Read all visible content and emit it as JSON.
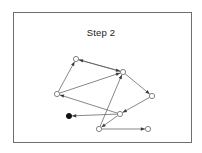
{
  "figure": {
    "title": "Step 2",
    "frame": {
      "x": 13,
      "y": 12,
      "width": 179,
      "height": 131,
      "border_color": "#6e6e6e"
    }
  },
  "chart_data": {
    "type": "scatter",
    "title": "Step 2",
    "xlabel": "",
    "ylabel": "",
    "grid": false,
    "legend": null,
    "xlim": [
      13,
      192
    ],
    "ylim": [
      12,
      143
    ],
    "node_style": {
      "open_fill": "#ffffff",
      "open_stroke": "#777777",
      "filled_fill": "#111111",
      "radius": 2.6
    },
    "edge_style": {
      "color": "#555555",
      "width": 0.7,
      "arrow_color": "#3a3a3a",
      "directed": true
    },
    "nodes": [
      {
        "id": "n1",
        "x": 76,
        "y": 59,
        "state": "open"
      },
      {
        "id": "n2",
        "x": 123,
        "y": 72,
        "state": "open"
      },
      {
        "id": "n3",
        "x": 57,
        "y": 94,
        "state": "open"
      },
      {
        "id": "n4",
        "x": 152,
        "y": 96,
        "state": "open"
      },
      {
        "id": "n5",
        "x": 120,
        "y": 114,
        "state": "open"
      },
      {
        "id": "n6",
        "x": 69,
        "y": 116,
        "state": "filled"
      },
      {
        "id": "n7",
        "x": 99,
        "y": 129,
        "state": "open"
      },
      {
        "id": "n8",
        "x": 148,
        "y": 129,
        "state": "open"
      }
    ],
    "edges": [
      {
        "from": "n3",
        "to": "n1"
      },
      {
        "from": "n3",
        "to": "n2"
      },
      {
        "from": "n2",
        "to": "n1"
      },
      {
        "from": "n1",
        "to": "n2"
      },
      {
        "from": "n5",
        "to": "n3"
      },
      {
        "from": "n7",
        "to": "n2"
      },
      {
        "from": "n2",
        "to": "n4"
      },
      {
        "from": "n4",
        "to": "n5"
      },
      {
        "from": "n5",
        "to": "n6"
      },
      {
        "from": "n5",
        "to": "n7"
      },
      {
        "from": "n7",
        "to": "n8"
      }
    ]
  }
}
